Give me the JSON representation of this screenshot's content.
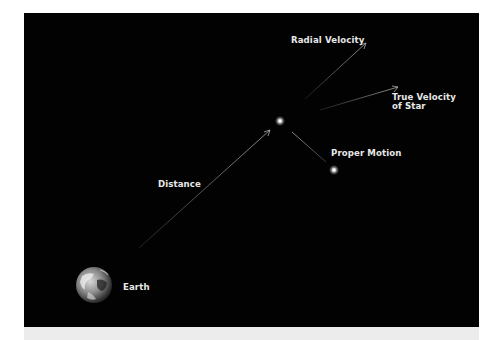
{
  "diagram": {
    "background_color": "#020202",
    "labels": {
      "radial_velocity": "Radial Velocity",
      "true_velocity_line1": "True Velocity",
      "true_velocity_line2": "of Star",
      "proper_motion": "Proper Motion",
      "distance": "Distance",
      "earth": "Earth"
    },
    "nodes": [
      {
        "name": "Earth",
        "icon": "earth-globe-icon"
      },
      {
        "name": "Star (current position)",
        "icon": "star-icon"
      },
      {
        "name": "Star (displaced position)",
        "icon": "star-icon"
      }
    ],
    "arrows": [
      {
        "from": "Earth",
        "to": "Star",
        "label": "Distance"
      },
      {
        "from": "Star",
        "direction": "up-right",
        "label": "Radial Velocity"
      },
      {
        "from": "Star",
        "direction": "right",
        "label": "True Velocity of Star"
      },
      {
        "from": "Star",
        "to": "Star (displaced)",
        "label": "Proper Motion"
      }
    ]
  }
}
